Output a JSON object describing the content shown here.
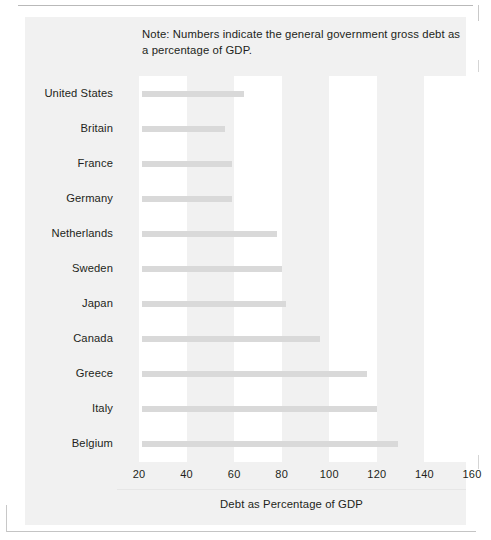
{
  "note": "Note: Numbers indicate the general government gross debt as a percentage of GDP.",
  "axis": {
    "title": "Debt as Percentage of GDP",
    "ticks": [
      "20",
      "40",
      "60",
      "80",
      "100",
      "120",
      "140",
      "160"
    ]
  },
  "colors": {
    "figure_background": "#f1f1f1",
    "plot_band": "#ffffff",
    "bar": "#d9d9d9",
    "text": "#231f20"
  },
  "chart_data": {
    "type": "bar",
    "orientation": "horizontal",
    "title": "",
    "subtitle": "",
    "note": "Note: Numbers indicate the general government gross debt as a percentage of GDP.",
    "xlabel": "Debt as Percentage of GDP",
    "ylabel": "",
    "xlim": [
      0,
      170
    ],
    "xticks": [
      20,
      40,
      60,
      80,
      100,
      120,
      140,
      160
    ],
    "grid": false,
    "legend": false,
    "categories": [
      "United States",
      "Britain",
      "France",
      "Germany",
      "Netherlands",
      "Sweden",
      "Japan",
      "Canada",
      "Greece",
      "Italy",
      "Belgium"
    ],
    "values": [
      64,
      56,
      59,
      59,
      78,
      80,
      82,
      96,
      116,
      120,
      129
    ]
  }
}
